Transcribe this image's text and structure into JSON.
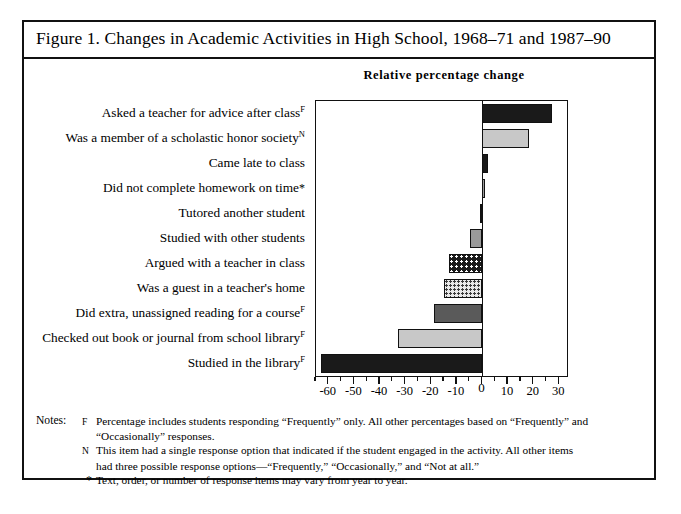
{
  "figure": {
    "caption": "Figure 1. Changes in Academic Activities in High School, 1968–71 and 1987–90",
    "chart_header": "Relative percentage change"
  },
  "chart_data": {
    "type": "bar",
    "orientation": "horizontal",
    "title": "Relative percentage change",
    "xlabel": "",
    "ylabel": "",
    "xlim": [
      -65,
      33
    ],
    "grid": false,
    "legend": false,
    "tick_labels": [
      "-60",
      "-50",
      "-40",
      "-30",
      "-20",
      "-10",
      "0",
      "10",
      "20",
      "30"
    ],
    "tick_values": [
      -60,
      -50,
      -40,
      -30,
      -20,
      -10,
      0,
      10,
      20,
      30
    ],
    "minor_tick_step": 5,
    "categories": [
      "Asked a teacher for advice after class",
      "Was a member of a scholastic honor society",
      "Came late to class",
      "Did not complete homework on time",
      "Tutored another student",
      "Studied with other students",
      "Argued with a teacher in class",
      "Was a guest in a teacher's home",
      "Did extra, unassigned reading for a course",
      "Checked out book or journal from school library",
      "Studied in the library"
    ],
    "category_markers": [
      "F",
      "N",
      "",
      "*",
      "",
      "",
      "",
      "",
      "F",
      "F",
      "F"
    ],
    "values": [
      27,
      18,
      2,
      1,
      -1,
      -5,
      -13,
      -15,
      -19,
      -33,
      -63
    ],
    "fills": [
      "dark-dense",
      "light-gray",
      "dark-solid",
      "mid-dense",
      "dark-dense",
      "mid-gray",
      "dark-checker",
      "light-checker",
      "dark-gray",
      "light-gray",
      "black"
    ]
  },
  "notes": {
    "label": "Notes:",
    "items": [
      {
        "marker": "F",
        "text": "Percentage includes students responding “Frequently” only. All other percentages based on “Frequently” and"
      },
      {
        "marker": "",
        "text": "“Occasionally” responses."
      },
      {
        "marker": "N",
        "text": "This item had a single response option that indicated if the student engaged in the activity. All other items"
      },
      {
        "marker": "",
        "text": "had three possible response options—“Frequently,” “Occasionally,” and “Not at all.”"
      },
      {
        "marker": "*",
        "text": "Text, order, or number of response items may vary from year to year."
      }
    ]
  },
  "colors": {
    "ink": "#111111",
    "paper": "#ffffff",
    "light_gray": "#c8c8c8",
    "mid_gray": "#9a9a9a",
    "dark_gray": "#5a5a5a",
    "black": "#1a1a1a"
  }
}
